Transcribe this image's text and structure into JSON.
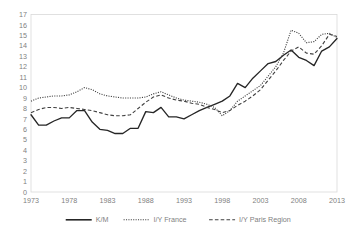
{
  "chart_data": {
    "type": "line",
    "title": "",
    "subtitle": "",
    "xlabel": "",
    "ylabel": "",
    "xlim": [
      1973,
      2013
    ],
    "ylim": [
      0,
      17
    ],
    "grid": false,
    "legend_position": "bottom",
    "x_ticks": [
      "1973",
      "1978",
      "1983",
      "1988",
      "1993",
      "1998",
      "2003",
      "2008",
      "2013"
    ],
    "x_tick_values": [
      1973,
      1978,
      1983,
      1988,
      1993,
      1998,
      2003,
      2008,
      2013
    ],
    "y_ticks": [
      "0",
      "1",
      "2",
      "3",
      "4",
      "5",
      "6",
      "7",
      "8",
      "9",
      "10",
      "11",
      "12",
      "13",
      "14",
      "15",
      "16",
      "17"
    ],
    "y_tick_values": [
      0,
      1,
      2,
      3,
      4,
      5,
      6,
      7,
      8,
      9,
      10,
      11,
      12,
      13,
      14,
      15,
      16,
      17
    ],
    "x": [
      1973,
      1974,
      1975,
      1976,
      1977,
      1978,
      1979,
      1980,
      1981,
      1982,
      1983,
      1984,
      1985,
      1986,
      1987,
      1988,
      1989,
      1990,
      1991,
      1992,
      1993,
      1994,
      1995,
      1996,
      1997,
      1998,
      1999,
      2000,
      2001,
      2002,
      2003,
      2004,
      2005,
      2006,
      2007,
      2008,
      2009,
      2010,
      2011,
      2012,
      2013
    ],
    "series": [
      {
        "name": "K/M",
        "style": "solid",
        "color": "#262626",
        "values": [
          7.4,
          6.4,
          6.4,
          6.8,
          7.1,
          7.1,
          7.8,
          7.8,
          6.7,
          6.0,
          5.9,
          5.6,
          5.6,
          6.1,
          6.1,
          7.7,
          7.6,
          8.1,
          7.2,
          7.2,
          7.0,
          7.4,
          7.8,
          8.1,
          8.4,
          8.7,
          9.2,
          10.4,
          10.0,
          10.9,
          11.6,
          12.3,
          12.5,
          13.1,
          13.6,
          12.9,
          12.6,
          12.1,
          13.5,
          13.9,
          14.7
        ]
      },
      {
        "name": "I/Y France",
        "style": "dotted",
        "color": "#404040",
        "values": [
          8.7,
          9.0,
          9.1,
          9.2,
          9.2,
          9.3,
          9.6,
          10.0,
          9.8,
          9.4,
          9.2,
          9.1,
          9.0,
          9.0,
          9.0,
          9.1,
          9.4,
          9.6,
          9.3,
          9.0,
          8.8,
          8.7,
          8.6,
          8.4,
          8.1,
          7.3,
          7.8,
          8.7,
          9.2,
          9.7,
          10.2,
          11.1,
          12.0,
          13.3,
          15.5,
          15.2,
          14.3,
          14.4,
          15.1,
          15.2,
          14.8
        ]
      },
      {
        "name": "I/Y Paris Region",
        "style": "dashed",
        "color": "#404040",
        "values": [
          7.6,
          7.9,
          8.1,
          8.1,
          8.0,
          8.1,
          8.0,
          7.9,
          7.8,
          7.6,
          7.4,
          7.3,
          7.3,
          7.4,
          8.0,
          8.6,
          9.1,
          9.3,
          9.0,
          8.8,
          8.7,
          8.5,
          8.4,
          8.1,
          7.9,
          7.6,
          7.8,
          8.3,
          8.7,
          9.2,
          9.8,
          10.7,
          11.6,
          12.6,
          13.5,
          13.9,
          13.3,
          13.2,
          14.0,
          15.1,
          14.9
        ]
      }
    ],
    "legend": [
      {
        "label": "K/M",
        "style": "solid"
      },
      {
        "label": "I/Y France",
        "style": "dotted"
      },
      {
        "label": "I/Y Paris Region",
        "style": "dashed"
      }
    ]
  }
}
